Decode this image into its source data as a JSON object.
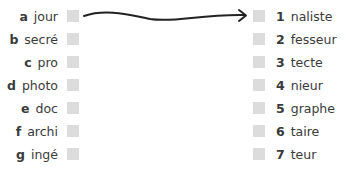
{
  "left_items": [
    {
      "letter": "a",
      "word": "jour"
    },
    {
      "letter": "b",
      "word": "secré"
    },
    {
      "letter": "c",
      "word": "pro"
    },
    {
      "letter": "d",
      "word": "photo"
    },
    {
      "letter": "e",
      "word": "doc"
    },
    {
      "letter": "f",
      "word": "archi"
    },
    {
      "letter": "g",
      "word": "ingé"
    }
  ],
  "right_items": [
    {
      "number": "1",
      "word": "naliste"
    },
    {
      "number": "2",
      "word": "fesseur"
    },
    {
      "number": "3",
      "word": "tecte"
    },
    {
      "number": "4",
      "word": "nieur"
    },
    {
      "number": "5",
      "word": "graphe"
    },
    {
      "number": "6",
      "word": "taire"
    },
    {
      "number": "7",
      "word": "teur"
    }
  ],
  "connections": [
    {
      "from": "a",
      "to": "1"
    }
  ],
  "colors": {
    "text": "#3a3a3a",
    "checkbox": "#dcdcdc",
    "arrow": "#222222"
  }
}
